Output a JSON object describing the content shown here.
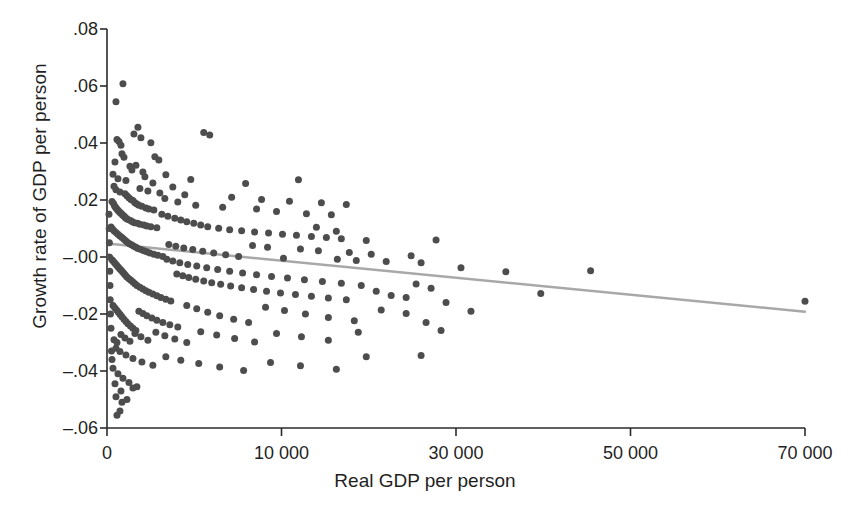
{
  "chart_data": {
    "type": "scatter",
    "title": "",
    "xlabel": "Real GDP per person",
    "ylabel": "Growth rate of GDP per person",
    "xlim": [
      0,
      70000
    ],
    "ylim": [
      -0.06,
      0.08
    ],
    "grid": false,
    "legend": "none",
    "x_ticks": [
      {
        "value": 0,
        "label": "0"
      },
      {
        "value": 17500,
        "label": "10 000"
      },
      {
        "value": 35000,
        "label": "30 000"
      },
      {
        "value": 52500,
        "label": "50 000"
      },
      {
        "value": 70000,
        "label": "70 000"
      }
    ],
    "y_ticks": [
      {
        "value": 0.08,
        "label": ".08"
      },
      {
        "value": 0.06,
        "label": ".06"
      },
      {
        "value": 0.04,
        "label": ".04"
      },
      {
        "value": 0.02,
        "label": ".02"
      },
      {
        "value": 0.0,
        "label": "–.00"
      },
      {
        "value": -0.02,
        "label": "–.02"
      },
      {
        "value": -0.04,
        "label": "–.04"
      },
      {
        "value": -0.06,
        "label": "–.06"
      }
    ],
    "marker": {
      "shape": "circle",
      "color": "#4d4d4d",
      "size_px": 7
    },
    "fit_line": {
      "name": "linear fit",
      "color": "#a8a8a8",
      "width_px": 2.5,
      "x": [
        0,
        70000
      ],
      "y": [
        0.0047,
        -0.0192
      ]
    },
    "points": [
      [
        900,
        0.0545
      ],
      [
        1600,
        0.0608
      ],
      [
        3100,
        0.0455
      ],
      [
        2700,
        0.0432
      ],
      [
        3400,
        0.0418
      ],
      [
        4400,
        0.0401
      ],
      [
        1000,
        0.0412
      ],
      [
        1200,
        0.0405
      ],
      [
        1400,
        0.0392
      ],
      [
        4800,
        0.0352
      ],
      [
        5200,
        0.034
      ],
      [
        9700,
        0.0437
      ],
      [
        10300,
        0.0428
      ],
      [
        1500,
        0.0362
      ],
      [
        1700,
        0.035
      ],
      [
        800,
        0.0333
      ],
      [
        2300,
        0.0318
      ],
      [
        2500,
        0.0305
      ],
      [
        2900,
        0.0322
      ],
      [
        3600,
        0.0298
      ],
      [
        600,
        0.029
      ],
      [
        1100,
        0.0275
      ],
      [
        1900,
        0.0268
      ],
      [
        3800,
        0.0282
      ],
      [
        4600,
        0.026
      ],
      [
        5900,
        0.0289
      ],
      [
        6600,
        0.0246
      ],
      [
        8400,
        0.0272
      ],
      [
        13900,
        0.0258
      ],
      [
        19200,
        0.0271
      ],
      [
        700,
        0.0248
      ],
      [
        900,
        0.0236
      ],
      [
        1300,
        0.0228
      ],
      [
        1800,
        0.0222
      ],
      [
        2000,
        0.0215
      ],
      [
        2200,
        0.0208
      ],
      [
        2400,
        0.0202
      ],
      [
        2600,
        0.0198
      ],
      [
        2800,
        0.019
      ],
      [
        3000,
        0.0186
      ],
      [
        3200,
        0.0182
      ],
      [
        3500,
        0.0178
      ],
      [
        3900,
        0.0172
      ],
      [
        4200,
        0.0168
      ],
      [
        4700,
        0.0165
      ],
      [
        500,
        0.0195
      ],
      [
        650,
        0.0188
      ],
      [
        750,
        0.018
      ],
      [
        850,
        0.0175
      ],
      [
        950,
        0.017
      ],
      [
        1050,
        0.0166
      ],
      [
        1150,
        0.0162
      ],
      [
        1250,
        0.0158
      ],
      [
        1350,
        0.0155
      ],
      [
        1450,
        0.0152
      ],
      [
        1550,
        0.0148
      ],
      [
        1650,
        0.0145
      ],
      [
        1750,
        0.0142
      ],
      [
        1850,
        0.0138
      ],
      [
        1950,
        0.0135
      ],
      [
        2100,
        0.0132
      ],
      [
        2350,
        0.0128
      ],
      [
        2550,
        0.0124
      ],
      [
        2750,
        0.012
      ],
      [
        3050,
        0.0118
      ],
      [
        3300,
        0.0115
      ],
      [
        3700,
        0.0112
      ],
      [
        4000,
        0.0109
      ],
      [
        4400,
        0.0106
      ],
      [
        5000,
        0.0103
      ],
      [
        5500,
        0.015
      ],
      [
        6100,
        0.0143
      ],
      [
        6800,
        0.0136
      ],
      [
        7400,
        0.013
      ],
      [
        8000,
        0.0124
      ],
      [
        8700,
        0.0118
      ],
      [
        9400,
        0.0112
      ],
      [
        10100,
        0.0106
      ],
      [
        11200,
        0.0101
      ],
      [
        12300,
        0.0096
      ],
      [
        13500,
        0.0092
      ],
      [
        14800,
        0.0088
      ],
      [
        16200,
        0.0084
      ],
      [
        17600,
        0.008
      ],
      [
        19000,
        0.0076
      ],
      [
        20500,
        0.0072
      ],
      [
        22000,
        0.0068
      ],
      [
        23500,
        0.0064
      ],
      [
        5800,
        0.0205
      ],
      [
        7100,
        0.0193
      ],
      [
        8900,
        0.0182
      ],
      [
        11600,
        0.0175
      ],
      [
        15000,
        0.0168
      ],
      [
        17000,
        0.016
      ],
      [
        20000,
        0.0152
      ],
      [
        21000,
        0.0104
      ],
      [
        22500,
        0.0148
      ],
      [
        23000,
        0.009
      ],
      [
        400,
        0.0105
      ],
      [
        550,
        0.0098
      ],
      [
        700,
        0.0092
      ],
      [
        900,
        0.0086
      ],
      [
        1100,
        0.008
      ],
      [
        1300,
        0.0074
      ],
      [
        1500,
        0.0068
      ],
      [
        1700,
        0.0062
      ],
      [
        1900,
        0.0056
      ],
      [
        2100,
        0.005
      ],
      [
        2300,
        0.0046
      ],
      [
        2500,
        0.0042
      ],
      [
        2700,
        0.0038
      ],
      [
        2900,
        0.0034
      ],
      [
        3100,
        0.003
      ],
      [
        3400,
        0.0026
      ],
      [
        3700,
        0.0022
      ],
      [
        4000,
        0.0018
      ],
      [
        4300,
        0.0014
      ],
      [
        4700,
        0.001
      ],
      [
        5100,
        0.0006
      ],
      [
        5600,
        0.0002
      ],
      [
        6200,
        0.0044
      ],
      [
        6900,
        0.0038
      ],
      [
        7700,
        0.0032
      ],
      [
        8600,
        0.0026
      ],
      [
        9600,
        0.002
      ],
      [
        10700,
        0.0014
      ],
      [
        11900,
        0.0008
      ],
      [
        13200,
        0.0002
      ],
      [
        14600,
        0.004
      ],
      [
        16100,
        0.0034
      ],
      [
        17700,
        -0.0004
      ],
      [
        19400,
        0.0028
      ],
      [
        21200,
        0.0022
      ],
      [
        23100,
        -0.0008
      ],
      [
        24300,
        0.0016
      ],
      [
        25000,
        -0.0012
      ],
      [
        26500,
        0.001
      ],
      [
        28000,
        -0.0016
      ],
      [
        30500,
        0.0004
      ],
      [
        31500,
        -0.002
      ],
      [
        33000,
        0.006
      ],
      [
        35500,
        -0.0038
      ],
      [
        40000,
        -0.0052
      ],
      [
        48500,
        -0.0048
      ],
      [
        70000,
        -0.0155
      ],
      [
        500,
        -0.001
      ],
      [
        650,
        -0.0016
      ],
      [
        800,
        -0.0022
      ],
      [
        950,
        -0.0028
      ],
      [
        1100,
        -0.0034
      ],
      [
        1250,
        -0.004
      ],
      [
        1400,
        -0.0046
      ],
      [
        1550,
        -0.0052
      ],
      [
        1700,
        -0.0058
      ],
      [
        1850,
        -0.0064
      ],
      [
        2000,
        -0.007
      ],
      [
        2200,
        -0.0076
      ],
      [
        2400,
        -0.0082
      ],
      [
        2600,
        -0.0088
      ],
      [
        2800,
        -0.0094
      ],
      [
        3000,
        -0.01
      ],
      [
        3300,
        -0.0106
      ],
      [
        3600,
        -0.0112
      ],
      [
        3900,
        -0.0118
      ],
      [
        4200,
        -0.0124
      ],
      [
        4600,
        -0.013
      ],
      [
        5000,
        -0.0136
      ],
      [
        5400,
        -0.0142
      ],
      [
        5900,
        -0.0148
      ],
      [
        6400,
        -0.0154
      ],
      [
        7000,
        -0.006
      ],
      [
        7600,
        -0.0066
      ],
      [
        8200,
        -0.0072
      ],
      [
        8900,
        -0.0078
      ],
      [
        9700,
        -0.0084
      ],
      [
        10500,
        -0.009
      ],
      [
        11400,
        -0.0096
      ],
      [
        12400,
        -0.0102
      ],
      [
        13500,
        -0.0108
      ],
      [
        14700,
        -0.0114
      ],
      [
        16000,
        -0.012
      ],
      [
        17400,
        -0.0126
      ],
      [
        18900,
        -0.0132
      ],
      [
        20500,
        -0.0138
      ],
      [
        22200,
        -0.0144
      ],
      [
        24000,
        -0.015
      ],
      [
        25500,
        -0.01
      ],
      [
        27000,
        -0.012
      ],
      [
        28500,
        -0.0135
      ],
      [
        30000,
        -0.0142
      ],
      [
        31000,
        -0.0095
      ],
      [
        32500,
        -0.011
      ],
      [
        34000,
        -0.016
      ],
      [
        36500,
        -0.019
      ],
      [
        43500,
        -0.0128
      ],
      [
        600,
        -0.017
      ],
      [
        780,
        -0.0178
      ],
      [
        960,
        -0.0186
      ],
      [
        1140,
        -0.0194
      ],
      [
        1320,
        -0.0202
      ],
      [
        1500,
        -0.021
      ],
      [
        1700,
        -0.0218
      ],
      [
        1900,
        -0.0226
      ],
      [
        2100,
        -0.0234
      ],
      [
        2350,
        -0.0242
      ],
      [
        2600,
        -0.025
      ],
      [
        2900,
        -0.0258
      ],
      [
        3200,
        -0.019
      ],
      [
        3600,
        -0.0198
      ],
      [
        4000,
        -0.0206
      ],
      [
        4500,
        -0.0214
      ],
      [
        5000,
        -0.0222
      ],
      [
        5600,
        -0.023
      ],
      [
        6300,
        -0.0238
      ],
      [
        7100,
        -0.0246
      ],
      [
        8000,
        -0.017
      ],
      [
        9000,
        -0.0182
      ],
      [
        10100,
        -0.0194
      ],
      [
        11300,
        -0.0206
      ],
      [
        12700,
        -0.0218
      ],
      [
        14200,
        -0.023
      ],
      [
        15900,
        -0.0176
      ],
      [
        17800,
        -0.0188
      ],
      [
        19900,
        -0.02
      ],
      [
        22200,
        -0.0212
      ],
      [
        24800,
        -0.0224
      ],
      [
        27500,
        -0.0186
      ],
      [
        30000,
        -0.0198
      ],
      [
        32000,
        -0.023
      ],
      [
        33500,
        -0.0258
      ],
      [
        700,
        -0.029
      ],
      [
        1000,
        -0.03
      ],
      [
        1400,
        -0.0272
      ],
      [
        1800,
        -0.0284
      ],
      [
        2300,
        -0.0296
      ],
      [
        2800,
        -0.0268
      ],
      [
        3400,
        -0.028
      ],
      [
        4100,
        -0.0292
      ],
      [
        4900,
        -0.0264
      ],
      [
        5800,
        -0.0276
      ],
      [
        6800,
        -0.0288
      ],
      [
        8000,
        -0.03
      ],
      [
        9400,
        -0.0262
      ],
      [
        11000,
        -0.0274
      ],
      [
        12800,
        -0.0286
      ],
      [
        14800,
        -0.0298
      ],
      [
        17000,
        -0.0268
      ],
      [
        19500,
        -0.028
      ],
      [
        22200,
        -0.0292
      ],
      [
        25200,
        -0.0264
      ],
      [
        900,
        -0.032
      ],
      [
        1300,
        -0.0332
      ],
      [
        1900,
        -0.0344
      ],
      [
        2600,
        -0.0356
      ],
      [
        3500,
        -0.0368
      ],
      [
        4600,
        -0.038
      ],
      [
        5900,
        -0.035
      ],
      [
        7400,
        -0.0362
      ],
      [
        9200,
        -0.0374
      ],
      [
        11300,
        -0.0386
      ],
      [
        13700,
        -0.0398
      ],
      [
        16400,
        -0.037
      ],
      [
        19400,
        -0.0382
      ],
      [
        23000,
        -0.0394
      ],
      [
        26000,
        -0.035
      ],
      [
        31500,
        -0.0346
      ],
      [
        1100,
        -0.041
      ],
      [
        1600,
        -0.0425
      ],
      [
        2200,
        -0.044
      ],
      [
        3000,
        -0.0455
      ],
      [
        1400,
        -0.047
      ],
      [
        900,
        -0.049
      ],
      [
        1500,
        -0.051
      ],
      [
        1300,
        -0.054
      ],
      [
        1000,
        -0.0555
      ],
      [
        2000,
        -0.05
      ],
      [
        2600,
        -0.046
      ],
      [
        800,
        -0.0445
      ],
      [
        600,
        -0.039
      ],
      [
        500,
        -0.036
      ],
      [
        450,
        -0.033
      ],
      [
        400,
        -0.025
      ],
      [
        350,
        -0.02
      ],
      [
        320,
        -0.015
      ],
      [
        300,
        -0.01
      ],
      [
        280,
        -0.005
      ],
      [
        260,
        0.0
      ],
      [
        240,
        0.005
      ],
      [
        220,
        0.01
      ],
      [
        200,
        0.015
      ],
      [
        3300,
        0.024
      ],
      [
        4100,
        0.0232
      ],
      [
        5300,
        0.0225
      ],
      [
        7800,
        0.0218
      ],
      [
        12500,
        0.021
      ],
      [
        15500,
        0.0202
      ],
      [
        18300,
        0.0196
      ],
      [
        21500,
        0.019
      ],
      [
        24000,
        0.0184
      ],
      [
        26000,
        0.0058
      ],
      [
        6000,
        -0.0008
      ],
      [
        6600,
        -0.0014
      ],
      [
        7300,
        -0.002
      ],
      [
        8100,
        -0.0026
      ],
      [
        9000,
        -0.0032
      ],
      [
        10000,
        -0.0038
      ],
      [
        11100,
        -0.0044
      ],
      [
        12300,
        -0.005
      ],
      [
        13600,
        -0.0056
      ],
      [
        15000,
        -0.0062
      ],
      [
        16500,
        -0.0068
      ],
      [
        18100,
        -0.0074
      ],
      [
        19800,
        -0.008
      ],
      [
        21600,
        -0.0086
      ],
      [
        23500,
        -0.0092
      ]
    ]
  }
}
